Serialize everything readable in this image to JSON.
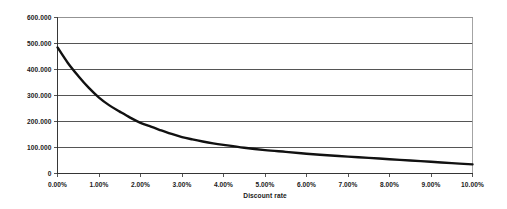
{
  "chart_data": {
    "type": "line",
    "title": "",
    "subtitle": "",
    "xlabel": "Discount rate",
    "ylabel": "",
    "xlim": [
      0,
      10
    ],
    "ylim": [
      0,
      600000
    ],
    "grid": true,
    "grid_axis": "y",
    "legend": false,
    "legend_position": "none",
    "background_color": "#ffffff",
    "line_color": "#111111",
    "gridline_color": "#2b2b2b",
    "border_color": "#9a9a9a",
    "x_tick_labels": [
      "0.00%",
      "1.00%",
      "2.00%",
      "3.00%",
      "4.00%",
      "5.00%",
      "6.00%",
      "7.00%",
      "8.00%",
      "9.00%",
      "10.00%"
    ],
    "x_tick_values": [
      0,
      1,
      2,
      3,
      4,
      5,
      6,
      7,
      8,
      9,
      10
    ],
    "y_tick_labels": [
      "0",
      "100.000",
      "200.000",
      "300.000",
      "400.000",
      "500.000",
      "600.000"
    ],
    "y_tick_values": [
      0,
      100000,
      200000,
      300000,
      400000,
      500000,
      600000
    ],
    "series": [
      {
        "name": "Present value",
        "x": [
          0,
          0.25,
          0.5,
          0.75,
          1,
          1.25,
          1.5,
          1.75,
          2,
          2.25,
          2.5,
          2.75,
          3,
          3.25,
          3.5,
          3.75,
          4,
          4.5,
          5,
          5.5,
          6,
          6.5,
          7,
          7.5,
          8,
          8.5,
          9,
          9.5,
          10
        ],
        "y": [
          485000,
          425000,
          375000,
          330000,
          292000,
          262000,
          238000,
          215000,
          195000,
          180000,
          166000,
          152000,
          140000,
          131000,
          123000,
          116000,
          110000,
          99000,
          90000,
          83000,
          76000,
          70000,
          65000,
          60000,
          55000,
          50000,
          45000,
          40000,
          35000
        ]
      }
    ]
  }
}
